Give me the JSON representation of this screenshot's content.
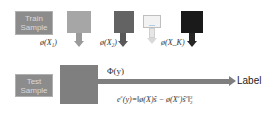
{
  "train": {
    "label_line1": "Train",
    "label_line2": "Sample",
    "features": [
      {
        "color": "#a6a6a6",
        "arrow_color": "#9a9a9a",
        "label": "ø(X₁)"
      },
      {
        "color": "#636363",
        "arrow_color": "#595959",
        "label": "ø(X₂)"
      },
      {
        "color": "#f2f2f2",
        "arrow_color": "#d9d9d9",
        "label": "...",
        "ellipsis": "..."
      },
      {
        "color": "#1a1a1a",
        "arrow_color": "#262626",
        "label": "ø(X_K)"
      }
    ]
  },
  "test": {
    "label_line1": "Test",
    "label_line2": "Sample",
    "feature_color": "#7f7f7f",
    "feature_label": "Φ(y)",
    "output_label": "Label"
  },
  "equation": {
    "lhs": "e",
    "lhs_sup": "c",
    "lhs_arg": "(y)=",
    "body": "‖ø(X)ŝ − ø(X",
    "body_sup": "c",
    "body_tail": ")ŝ",
    "body_tail_sup": "c",
    "norm_close": "‖",
    "norm_sub": "2",
    "norm_sup": "2"
  },
  "colors": {
    "sample_box": "#8c8c8c",
    "sample_text": "#d9d9d9",
    "main_arrow": "#7f7f7f"
  }
}
